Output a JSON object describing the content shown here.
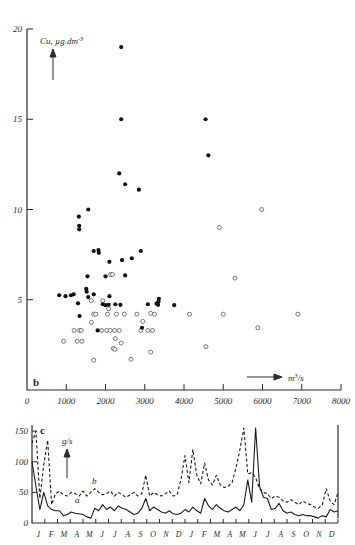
{
  "figure": {
    "panel_b": {
      "label": "b",
      "ylabel": "Cu, µg.dm",
      "ylabel_exp": "-3",
      "xlabel": "m",
      "xlabel_exp": "3",
      "xlabel_den": "/s",
      "y_ticks": [
        0,
        5,
        10,
        15,
        20
      ],
      "y_tick_labels": [
        "",
        "5",
        "10",
        "15",
        "20"
      ],
      "x_ticks": [
        0,
        1000,
        2000,
        3000,
        4000,
        5000,
        6000,
        7000,
        8000
      ],
      "x_tick_labels": [
        "0",
        "1000",
        "2000",
        "3000",
        "4000",
        "5000",
        "6000",
        "7000",
        "8000"
      ],
      "ylim": [
        0,
        20
      ],
      "xlim": [
        0,
        8000
      ]
    },
    "panel_c": {
      "label": "c",
      "ylabel": "g/s",
      "y_ticks": [
        0,
        50,
        100,
        150
      ],
      "y_tick_labels": [
        "0",
        "50",
        "100",
        "150"
      ],
      "ylim": [
        0,
        160
      ],
      "series_a_label": "a",
      "series_b_label": "b",
      "months": [
        "J",
        "F",
        "M",
        "A",
        "M",
        "J",
        "J",
        "A",
        "S",
        "O",
        "N",
        "D",
        "J",
        "F",
        "M",
        "A",
        "M",
        "J",
        "J",
        "A",
        "S",
        "O",
        "N",
        "D"
      ]
    }
  },
  "chart_data": [
    {
      "type": "scatter",
      "panel": "b",
      "title": "",
      "xlabel": "m3/s",
      "ylabel": "Cu, µg.dm-3",
      "xlim": [
        0,
        8000
      ],
      "ylim": [
        0,
        20
      ],
      "grid": false,
      "legend_position": "none",
      "series": [
        {
          "name": "filled",
          "marker": "filled-circle",
          "points": [
            [
              2400,
              19.0
            ],
            [
              2400,
              15.0
            ],
            [
              4550,
              15.0
            ],
            [
              4620,
              13.0
            ],
            [
              2350,
              12.0
            ],
            [
              2500,
              11.4
            ],
            [
              2850,
              11.1
            ],
            [
              1560,
              10.0
            ],
            [
              1320,
              9.6
            ],
            [
              1330,
              9.1
            ],
            [
              1330,
              8.9
            ],
            [
              1700,
              7.7
            ],
            [
              1820,
              7.75
            ],
            [
              1830,
              7.6
            ],
            [
              2900,
              7.7
            ],
            [
              2670,
              7.3
            ],
            [
              2100,
              7.1
            ],
            [
              2420,
              7.2
            ],
            [
              1540,
              6.3
            ],
            [
              2000,
              6.3
            ],
            [
              2500,
              6.35
            ],
            [
              1510,
              5.6
            ],
            [
              1520,
              5.45
            ],
            [
              1190,
              5.3
            ],
            [
              1700,
              5.3
            ],
            [
              820,
              5.25
            ],
            [
              980,
              5.2
            ],
            [
              1120,
              5.25
            ],
            [
              1560,
              5.15
            ],
            [
              2100,
              5.2
            ],
            [
              1300,
              4.8
            ],
            [
              1930,
              4.75
            ],
            [
              2000,
              4.7
            ],
            [
              2080,
              4.72
            ],
            [
              2250,
              4.75
            ],
            [
              2380,
              4.72
            ],
            [
              3080,
              4.75
            ],
            [
              3300,
              4.78
            ],
            [
              3340,
              4.72
            ],
            [
              3350,
              4.9
            ],
            [
              3360,
              5.05
            ],
            [
              3750,
              4.7
            ],
            [
              1340,
              4.1
            ],
            [
              1800,
              3.3
            ],
            [
              2930,
              3.45
            ]
          ]
        },
        {
          "name": "open",
          "marker": "open-circle",
          "points": [
            [
              5980,
              10.0
            ],
            [
              4900,
              9.0
            ],
            [
              2130,
              6.4
            ],
            [
              2180,
              6.4
            ],
            [
              5300,
              6.2
            ],
            [
              1640,
              4.95
            ],
            [
              1930,
              4.95
            ],
            [
              2080,
              4.5
            ],
            [
              1700,
              4.2
            ],
            [
              1750,
              4.2
            ],
            [
              2050,
              4.2
            ],
            [
              2280,
              4.2
            ],
            [
              2480,
              4.2
            ],
            [
              2800,
              4.2
            ],
            [
              3150,
              4.25
            ],
            [
              3250,
              4.2
            ],
            [
              4140,
              4.2
            ],
            [
              5000,
              4.2
            ],
            [
              6900,
              4.2
            ],
            [
              2950,
              3.8
            ],
            [
              1640,
              3.75
            ],
            [
              1200,
              3.3
            ],
            [
              1340,
              3.3
            ],
            [
              1380,
              3.3
            ],
            [
              1900,
              3.3
            ],
            [
              2030,
              3.3
            ],
            [
              2120,
              3.3
            ],
            [
              2230,
              3.3
            ],
            [
              2350,
              3.3
            ],
            [
              2900,
              3.3
            ],
            [
              3080,
              3.3
            ],
            [
              3200,
              3.3
            ],
            [
              930,
              2.7
            ],
            [
              1280,
              2.7
            ],
            [
              1400,
              2.7
            ],
            [
              2250,
              2.85
            ],
            [
              2400,
              2.6
            ],
            [
              2200,
              2.3
            ],
            [
              2240,
              2.25
            ],
            [
              4560,
              2.4
            ],
            [
              3150,
              2.1
            ],
            [
              1700,
              1.65
            ],
            [
              2650,
              1.7
            ],
            [
              5880,
              3.45
            ]
          ]
        }
      ]
    },
    {
      "type": "line",
      "panel": "c",
      "title": "",
      "xlabel": "",
      "ylabel": "g/s",
      "ylim": [
        0,
        160
      ],
      "grid": false,
      "legend_position": "inline",
      "categories": [
        "J",
        "F",
        "M",
        "A",
        "M",
        "J",
        "J",
        "A",
        "S",
        "O",
        "N",
        "D",
        "J",
        "F",
        "M",
        "A",
        "M",
        "J",
        "J",
        "A",
        "S",
        "O",
        "N",
        "D"
      ],
      "series": [
        {
          "name": "a",
          "style": "solid",
          "values": [
            100,
            60,
            22,
            50,
            28,
            22,
            20,
            20,
            12,
            14,
            18,
            16,
            15,
            14,
            10,
            8,
            24,
            20,
            30,
            22,
            26,
            20,
            28,
            24,
            22,
            18,
            14,
            16,
            24,
            40,
            20,
            26,
            22,
            18,
            16,
            20,
            15,
            14,
            16,
            22,
            18,
            26,
            20,
            16,
            40,
            28,
            22,
            30,
            24,
            20,
            18,
            22,
            26,
            20,
            30,
            70,
            34,
            155,
            60,
            42,
            40,
            22,
            24,
            32,
            20,
            16,
            18,
            14,
            12,
            14,
            12,
            12,
            10,
            8,
            12,
            10,
            22,
            18,
            20
          ]
        },
        {
          "name": "b",
          "style": "dashed",
          "values": [
            130,
            150,
            40,
            95,
            135,
            30,
            48,
            52,
            46,
            44,
            50,
            48,
            44,
            52,
            44,
            50,
            56,
            50,
            46,
            48,
            52,
            44,
            50,
            46,
            42,
            46,
            50,
            44,
            48,
            78,
            44,
            50,
            46,
            44,
            48,
            52,
            44,
            46,
            72,
            110,
            66,
            120,
            78,
            64,
            98,
            70,
            62,
            78,
            62,
            58,
            60,
            66,
            90,
            120,
            155,
            80,
            82,
            74,
            56,
            50,
            48,
            40,
            44,
            42,
            36,
            34,
            38,
            34,
            30,
            36,
            32,
            30,
            26,
            24,
            30,
            56,
            36,
            30,
            50
          ]
        }
      ]
    }
  ]
}
